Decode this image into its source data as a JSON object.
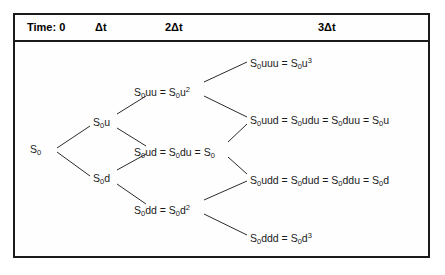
{
  "figure": {
    "frame": {
      "border_color": "#1a1a1a",
      "background": "#fefefe"
    }
  },
  "header": {
    "columns": [
      {
        "label": "Time: 0",
        "x": 27,
        "y": 21
      },
      {
        "label": "Δt",
        "x": 95,
        "y": 21
      },
      {
        "label": "2Δt",
        "x": 165,
        "y": 21
      },
      {
        "label": "3Δt",
        "x": 318,
        "y": 21
      }
    ]
  },
  "tree": {
    "nodes": [
      {
        "id": "s0",
        "step": 0,
        "label_html": "S<sub>0</sub>",
        "text": "S0",
        "x": 30,
        "y": 143
      },
      {
        "id": "u",
        "step": 1,
        "label_html": "S<sub>0</sub>u",
        "text": "S0u",
        "x": 93,
        "y": 116
      },
      {
        "id": "d",
        "step": 1,
        "label_html": "S<sub>0</sub>d",
        "text": "S0d",
        "x": 93,
        "y": 172
      },
      {
        "id": "uu",
        "step": 2,
        "label_html": "S<sub>0</sub>uu = S<sub>0</sub>u<sup>2</sup>",
        "text": "S0uu = S0u2",
        "x": 134,
        "y": 86
      },
      {
        "id": "ud",
        "step": 2,
        "label_html": "S<sub>0</sub>ud = S<sub>0</sub>du = S<sub>0</sub>",
        "text": "S0ud = S0du = S0",
        "x": 134,
        "y": 146
      },
      {
        "id": "dd",
        "step": 2,
        "label_html": "S<sub>0</sub>dd = S<sub>0</sub>d<sup>2</sup>",
        "text": "S0dd = S0d2",
        "x": 134,
        "y": 204
      },
      {
        "id": "uuu",
        "step": 3,
        "label_html": "S<sub>0</sub>uuu = S<sub>0</sub>u<sup>3</sup>",
        "text": "S0uuu = S0u3",
        "x": 250,
        "y": 57
      },
      {
        "id": "uud",
        "step": 3,
        "label_html": "S<sub>0</sub>uud = S<sub>0</sub>udu = S<sub>0</sub>duu = S<sub>0</sub>u",
        "text": "S0uud = S0udu = S0duu = S0u",
        "x": 250,
        "y": 114
      },
      {
        "id": "udd",
        "step": 3,
        "label_html": "S<sub>0</sub>udd = S<sub>0</sub>dud = S<sub>0</sub>ddu = S<sub>0</sub>d",
        "text": "S0udd = S0dud = S0ddu = S0d",
        "x": 250,
        "y": 174
      },
      {
        "id": "ddd",
        "step": 3,
        "label_html": "S<sub>0</sub>ddd = S<sub>0</sub>d<sup>3</sup>",
        "text": "S0ddd = S0d3",
        "x": 250,
        "y": 232
      }
    ],
    "edges": [
      {
        "from": "s0",
        "to": "u",
        "x1": 57,
        "y1": 148,
        "x2": 90,
        "y2": 126
      },
      {
        "from": "s0",
        "to": "d",
        "x1": 57,
        "y1": 152,
        "x2": 90,
        "y2": 176
      },
      {
        "from": "u",
        "to": "uu",
        "x1": 117,
        "y1": 114,
        "x2": 146,
        "y2": 96
      },
      {
        "from": "u",
        "to": "ud",
        "x1": 117,
        "y1": 128,
        "x2": 146,
        "y2": 146
      },
      {
        "from": "d",
        "to": "ud",
        "x1": 117,
        "y1": 170,
        "x2": 146,
        "y2": 154
      },
      {
        "from": "d",
        "to": "dd",
        "x1": 117,
        "y1": 184,
        "x2": 146,
        "y2": 204
      },
      {
        "from": "uu",
        "to": "uuu",
        "x1": 204,
        "y1": 82,
        "x2": 247,
        "y2": 62
      },
      {
        "from": "uu",
        "to": "uud",
        "x1": 204,
        "y1": 96,
        "x2": 247,
        "y2": 117
      },
      {
        "from": "ud",
        "to": "uud",
        "x1": 228,
        "y1": 142,
        "x2": 247,
        "y2": 124
      },
      {
        "from": "ud",
        "to": "udd",
        "x1": 228,
        "y1": 157,
        "x2": 247,
        "y2": 174
      },
      {
        "from": "dd",
        "to": "udd",
        "x1": 204,
        "y1": 200,
        "x2": 247,
        "y2": 181
      },
      {
        "from": "dd",
        "to": "ddd",
        "x1": 204,
        "y1": 214,
        "x2": 247,
        "y2": 235
      }
    ],
    "edge_color": "#2b2b2b"
  },
  "chart_data": {
    "type": "diagram",
    "subtype": "binomial-tree",
    "steps": [
      "Time: 0",
      "Δt",
      "2Δt",
      "3Δt"
    ],
    "levels": [
      {
        "step": 0,
        "values": [
          "S0"
        ]
      },
      {
        "step": 1,
        "values": [
          "S0u",
          "S0d"
        ]
      },
      {
        "step": 2,
        "values": [
          "S0uu = S0u^2",
          "S0ud = S0du = S0",
          "S0dd = S0d^2"
        ]
      },
      {
        "step": 3,
        "values": [
          "S0uuu = S0u^3",
          "S0uud = S0udu = S0duu = S0u",
          "S0udd = S0dud = S0ddu = S0d",
          "S0ddd = S0d^3"
        ]
      }
    ],
    "recombining": true,
    "branching_factor": 2
  }
}
